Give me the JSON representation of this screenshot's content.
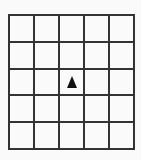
{
  "grid": {
    "rows": 5,
    "cols": 5,
    "line_color": "#333333",
    "background": "#fafafa"
  },
  "agent": {
    "icon": "triangle-up-icon",
    "row": 2,
    "col": 2,
    "direction": "up",
    "color": "#111111"
  }
}
